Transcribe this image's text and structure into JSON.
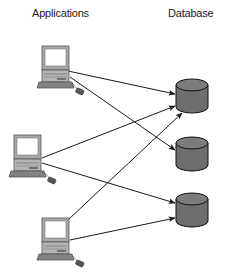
{
  "headers": {
    "applications": "Applications",
    "database": "Database"
  },
  "colors": {
    "line": "#1a1a1a",
    "cylinder_fill": "#6e6e6e",
    "cylinder_top": "#7a7a7a",
    "monitor_frame": "#9a9a9a",
    "screen": "#ffffff"
  },
  "applications": [
    {
      "id": "app-1",
      "icon": "computer-icon"
    },
    {
      "id": "app-2",
      "icon": "computer-icon"
    },
    {
      "id": "app-3",
      "icon": "computer-icon"
    }
  ],
  "databases": [
    {
      "id": "db-1",
      "icon": "database-cylinder-icon"
    },
    {
      "id": "db-2",
      "icon": "database-cylinder-icon"
    },
    {
      "id": "db-3",
      "icon": "database-cylinder-icon"
    }
  ],
  "connections": [
    {
      "from": "app-1",
      "to": "db-1"
    },
    {
      "from": "app-1",
      "to": "db-2"
    },
    {
      "from": "app-2",
      "to": "db-1"
    },
    {
      "from": "app-2",
      "to": "db-3"
    },
    {
      "from": "app-3",
      "to": "db-1"
    },
    {
      "from": "app-3",
      "to": "db-3"
    }
  ]
}
